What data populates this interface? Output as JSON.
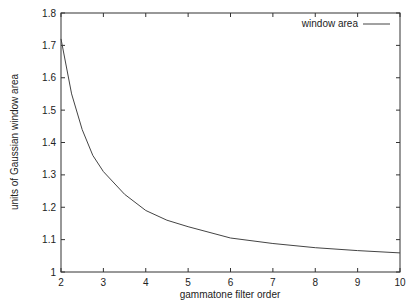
{
  "chart_data": {
    "type": "line",
    "title": "",
    "xlabel": "gammatone filter order",
    "ylabel": "units of Gaussian window area",
    "xlim": [
      2,
      10
    ],
    "ylim": [
      1,
      1.8
    ],
    "xticks": [
      "2",
      "3",
      "4",
      "5",
      "6",
      "7",
      "8",
      "9",
      "10"
    ],
    "yticks": [
      "1",
      "1.1",
      "1.2",
      "1.3",
      "1.4",
      "1.5",
      "1.6",
      "1.7",
      "1.8"
    ],
    "grid": false,
    "legend_position": "top-right",
    "series": [
      {
        "name": "window area",
        "x": [
          2,
          2.25,
          2.5,
          2.75,
          3,
          3.5,
          4,
          4.5,
          5,
          6,
          7,
          8,
          9,
          10
        ],
        "values": [
          1.72,
          1.55,
          1.44,
          1.36,
          1.31,
          1.24,
          1.19,
          1.16,
          1.14,
          1.105,
          1.088,
          1.075,
          1.066,
          1.059
        ]
      }
    ]
  }
}
